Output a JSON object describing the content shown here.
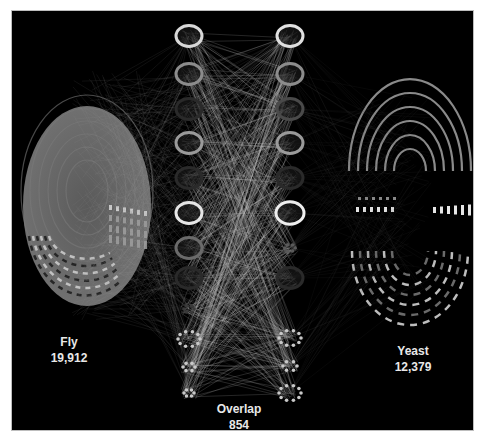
{
  "diagram": {
    "type": "network-overlap",
    "background": "#000000",
    "edge_color": "#c8c8c8",
    "groups": [
      {
        "id": "fly",
        "name": "Fly",
        "count": "19,912",
        "color": "#6e6e6e"
      },
      {
        "id": "overlap",
        "name": "Overlap",
        "count": "854",
        "color": "#bfbfbf"
      },
      {
        "id": "yeast",
        "name": "Yeast",
        "count": "12,379",
        "color": "#8a8a8a"
      }
    ],
    "overlap_clusters": {
      "left_column": [
        {
          "shape": "ring",
          "tone": "#d8d8d8"
        },
        {
          "shape": "ring",
          "tone": "#8c8c8c"
        },
        {
          "shape": "ring",
          "tone": "#2a2a2a"
        },
        {
          "shape": "ring",
          "tone": "#9a9a9a"
        },
        {
          "shape": "ring",
          "tone": "#2a2a2a"
        },
        {
          "shape": "ring",
          "tone": "#e6e6e6"
        },
        {
          "shape": "ring",
          "tone": "#6a6a6a"
        },
        {
          "shape": "ring",
          "tone": "#2a2a2a"
        },
        {
          "shape": "dots",
          "tone": "#3a3a3a"
        },
        {
          "shape": "dots",
          "tone": "#c8c8c8"
        },
        {
          "shape": "dots",
          "tone": "#c8c8c8"
        },
        {
          "shape": "dots",
          "tone": "#c8c8c8"
        }
      ],
      "right_column": [
        {
          "shape": "ring",
          "tone": "#e0e0e0"
        },
        {
          "shape": "ring",
          "tone": "#8c8c8c"
        },
        {
          "shape": "ring",
          "tone": "#4a4a4a"
        },
        {
          "shape": "ring",
          "tone": "#9a9a9a"
        },
        {
          "shape": "ring",
          "tone": "#2a2a2a"
        },
        {
          "shape": "ring",
          "tone": "#eeeeee"
        },
        {
          "shape": "dots",
          "tone": "#5a5a5a"
        },
        {
          "shape": "ring",
          "tone": "#2a2a2a"
        },
        {
          "shape": "dots",
          "tone": "#c8c8c8"
        },
        {
          "shape": "dots",
          "tone": "#c8c8c8"
        },
        {
          "shape": "dots",
          "tone": "#c8c8c8"
        }
      ]
    }
  }
}
